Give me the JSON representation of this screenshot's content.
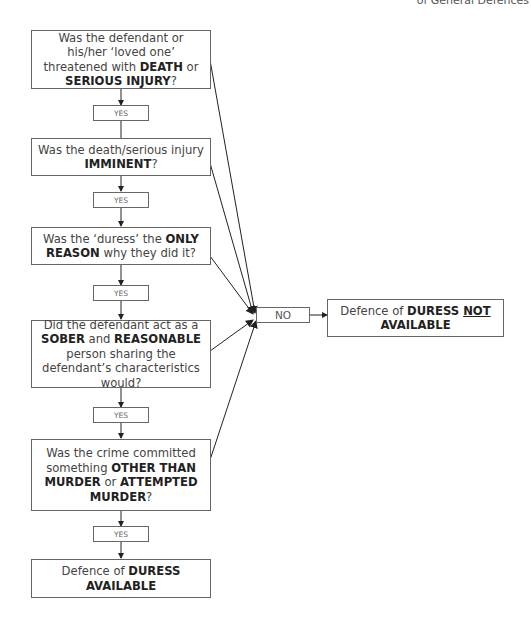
{
  "header": {
    "title": "of General Defences"
  },
  "flowchart": {
    "questions": [
      {
        "id": "q1",
        "text_parts": [
          {
            "t": "Was the defendant or his/her ‘loved one’ threatened with ",
            "b": false
          },
          {
            "t": "DEATH",
            "b": true
          },
          {
            "t": " or ",
            "b": false
          },
          {
            "t": "SERIOUS INJURY",
            "b": true
          },
          {
            "t": "?",
            "b": false
          }
        ]
      },
      {
        "id": "q2",
        "text_parts": [
          {
            "t": "Was the death/serious injury ",
            "b": false
          },
          {
            "t": "IMMINENT",
            "b": true
          },
          {
            "t": "?",
            "b": false
          }
        ]
      },
      {
        "id": "q3",
        "text_parts": [
          {
            "t": "Was the ‘duress’ the ",
            "b": false
          },
          {
            "t": "ONLY REASON",
            "b": true
          },
          {
            "t": " why they did it?",
            "b": false
          }
        ]
      },
      {
        "id": "q4",
        "text_parts": [
          {
            "t": "Did the defendant act as a ",
            "b": false
          },
          {
            "t": "SOBER",
            "b": true
          },
          {
            "t": " and ",
            "b": false
          },
          {
            "t": "REASONABLE",
            "b": true
          },
          {
            "t": " person sharing the defendant’s characteristics would?",
            "b": false
          }
        ]
      },
      {
        "id": "q5",
        "text_parts": [
          {
            "t": "Was the crime committed something ",
            "b": false
          },
          {
            "t": "OTHER THAN MURDER",
            "b": true
          },
          {
            "t": " or ",
            "b": false
          },
          {
            "t": "ATTEMPTED MURDER",
            "b": true
          },
          {
            "t": "?",
            "b": false
          }
        ]
      }
    ],
    "yes_label": "YES",
    "no_label": "NO",
    "outcome_yes": {
      "text_parts": [
        {
          "t": "Defence of ",
          "b": false
        },
        {
          "t": "DURESS AVAILABLE",
          "b": true
        }
      ]
    },
    "outcome_no": {
      "text_parts": [
        {
          "t": "Defence of ",
          "b": false
        },
        {
          "t": "DURESS ",
          "b": true
        },
        {
          "t": "NOT",
          "b": true,
          "u": true
        },
        {
          "t": " AVAILABLE",
          "b": true
        }
      ]
    },
    "line_color": "#222222",
    "border_color": "#666666"
  }
}
